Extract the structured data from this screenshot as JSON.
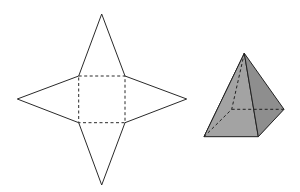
{
  "figure": {
    "net": {
      "base_shape": "square",
      "face_count": 4,
      "face_shape": "isosceles triangle",
      "fold_lines": "dashed"
    },
    "solid": {
      "name": "square pyramid",
      "hidden_edges": "dashed",
      "colors": {
        "stroke": "#222222",
        "left_face": "#c4c4c4",
        "front_face": "#a3a3a3",
        "right_face": "#8e8e8e",
        "base": "#9a9a9a"
      }
    }
  }
}
